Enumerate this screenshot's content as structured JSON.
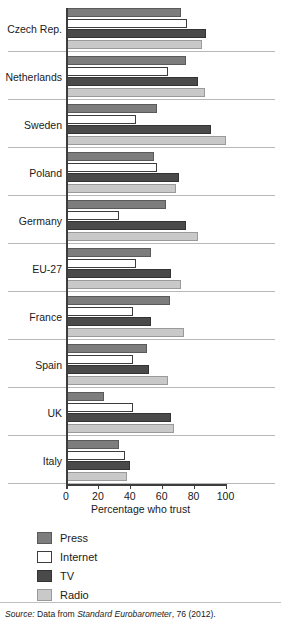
{
  "chart_data": {
    "type": "bar",
    "orientation": "horizontal",
    "title": "",
    "xlabel": "Percentage who trust",
    "ylabel": "",
    "xlim": [
      0,
      100
    ],
    "xticks": [
      0,
      20,
      40,
      60,
      80,
      100
    ],
    "grid": false,
    "legend_position": "bottom-left",
    "categories": [
      "Czech Rep.",
      "Netherlands",
      "Sweden",
      "Poland",
      "Germany",
      "EU-27",
      "France",
      "Spain",
      "UK",
      "Italy"
    ],
    "series": [
      {
        "name": "Press",
        "color": "#7d7d7d",
        "values": [
          72,
          75,
          57,
          55,
          63,
          53,
          65,
          51,
          24,
          33
        ]
      },
      {
        "name": "Internet",
        "color": "#ffffff",
        "values": [
          76,
          64,
          44,
          57,
          33,
          44,
          42,
          42,
          42,
          37
        ]
      },
      {
        "name": "TV",
        "color": "#4a4a4a",
        "values": [
          88,
          83,
          91,
          71,
          75,
          66,
          53,
          52,
          66,
          40
        ]
      },
      {
        "name": "Radio",
        "color": "#c9c9c9",
        "values": [
          85,
          87,
          100,
          69,
          83,
          72,
          74,
          64,
          68,
          38
        ]
      }
    ]
  },
  "legend": {
    "items": [
      {
        "label": "Press",
        "key": "press"
      },
      {
        "label": "Internet",
        "key": "internet"
      },
      {
        "label": "TV",
        "key": "tv"
      },
      {
        "label": "Radio",
        "key": "radio"
      }
    ]
  },
  "source": {
    "prefix": "Source:",
    "text_before": "Data from",
    "publication": "Standard Eurobarometer",
    "text_after": ", 76 (2012)."
  }
}
